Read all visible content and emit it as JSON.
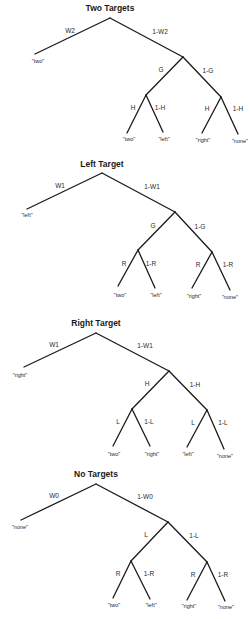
{
  "diagram": {
    "type": "probability-trees",
    "trees": [
      {
        "title": "Two Targets",
        "title_pos": [
          110,
          11
        ],
        "root": [
          110,
          18
        ],
        "left_leaf": {
          "pos": [
            35,
            54
          ],
          "label": "\"two\"",
          "label_pos": [
            38,
            63
          ],
          "edge_label": "W2",
          "edge_label_pos": [
            70,
            33
          ]
        },
        "right_node": {
          "pos": [
            183,
            57
          ],
          "edge_label": "1-W2",
          "edge_label_pos": [
            160,
            34
          ]
        },
        "mid_left": {
          "pos": [
            146,
            95
          ],
          "edge_label": "G",
          "edge_label_pos": [
            161,
            72
          ]
        },
        "mid_right": {
          "pos": [
            221,
            97
          ],
          "edge_label": "1-G",
          "edge_label_pos": [
            208,
            73
          ]
        },
        "leaves": [
          {
            "from": "mid_left",
            "pos": [
              127,
              133
            ],
            "label": "\"two\"",
            "label_pos": [
              129,
              141
            ],
            "edge_label": "H",
            "edge_label_pos": [
              133,
              110
            ]
          },
          {
            "from": "mid_left",
            "pos": [
              163,
              132
            ],
            "label": "\"left\"",
            "label_pos": [
              164,
              141
            ],
            "edge_label": "1-H",
            "edge_label_pos": [
              160,
              110
            ]
          },
          {
            "from": "mid_right",
            "pos": [
              202,
              133
            ],
            "label": "\"right\"",
            "label_pos": [
              203,
              142
            ],
            "edge_label": "H",
            "edge_label_pos": [
              207,
              111
            ]
          },
          {
            "from": "mid_right",
            "pos": [
              238,
              134
            ],
            "label": "\"none\"",
            "label_pos": [
              240,
              143
            ],
            "edge_label": "1-H",
            "edge_label_pos": [
              238,
              111
            ]
          }
        ]
      },
      {
        "title": "Left Target",
        "title_pos": [
          102,
          167
        ],
        "root": [
          102,
          173
        ],
        "left_leaf": {
          "pos": [
            27,
            209
          ],
          "label": "\"left\"",
          "label_pos": [
            27,
            217
          ],
          "edge_label": "W1",
          "edge_label_pos": [
            60,
            188
          ]
        },
        "right_node": {
          "pos": [
            175,
            212
          ],
          "edge_label": "1-W1",
          "edge_label_pos": [
            152,
            189
          ]
        },
        "mid_left": {
          "pos": [
            138,
            250
          ],
          "edge_label": "G",
          "edge_label_pos": [
            153,
            228
          ]
        },
        "mid_right": {
          "pos": [
            212,
            252
          ],
          "edge_label": "1-G",
          "edge_label_pos": [
            200,
            229
          ]
        },
        "leaves": [
          {
            "from": "mid_left",
            "pos": [
              118,
              286
            ],
            "label": "\"two\"",
            "label_pos": [
              120,
              297
            ],
            "edge_label": "R",
            "edge_label_pos": [
              124,
              266
            ]
          },
          {
            "from": "mid_left",
            "pos": [
              155,
              288
            ],
            "label": "\"left\"",
            "label_pos": [
              156,
              297
            ],
            "edge_label": "1-R",
            "edge_label_pos": [
              151,
              266
            ]
          },
          {
            "from": "mid_right",
            "pos": [
              192,
              288
            ],
            "label": "\"right\"",
            "label_pos": [
              194,
              298
            ],
            "edge_label": "R",
            "edge_label_pos": [
              198,
              267
            ]
          },
          {
            "from": "mid_right",
            "pos": [
              230,
              290
            ],
            "label": "\"none\"",
            "label_pos": [
              230,
              299
            ],
            "edge_label": "1-R",
            "edge_label_pos": [
              228,
              267
            ]
          }
        ]
      },
      {
        "title": "Right Target",
        "title_pos": [
          96,
          326
        ],
        "root": [
          96,
          333
        ],
        "left_leaf": {
          "pos": [
            24,
            367
          ],
          "label": "\"right\"",
          "label_pos": [
            20,
            377
          ],
          "edge_label": "W1",
          "edge_label_pos": [
            54,
            347
          ]
        },
        "right_node": {
          "pos": [
            169,
            371
          ],
          "edge_label": "1-W1",
          "edge_label_pos": [
            145,
            348
          ]
        },
        "mid_left": {
          "pos": [
            132,
            409
          ],
          "edge_label": "H",
          "edge_label_pos": [
            147,
            386
          ]
        },
        "mid_right": {
          "pos": [
            207,
            410
          ],
          "edge_label": "1-H",
          "edge_label_pos": [
            195,
            387
          ]
        },
        "leaves": [
          {
            "from": "mid_left",
            "pos": [
              113,
              446
            ],
            "label": "\"two\"",
            "label_pos": [
              114,
              456
            ],
            "edge_label": "L",
            "edge_label_pos": [
              118,
              424
            ]
          },
          {
            "from": "mid_left",
            "pos": [
              150,
              446
            ],
            "label": "\"right\"",
            "label_pos": [
              152,
              456
            ],
            "edge_label": "1-L",
            "edge_label_pos": [
              149,
              424
            ]
          },
          {
            "from": "mid_right",
            "pos": [
              187,
              447
            ],
            "label": "\"left\"",
            "label_pos": [
              188,
              456
            ],
            "edge_label": "L",
            "edge_label_pos": [
              193,
              425
            ]
          },
          {
            "from": "mid_right",
            "pos": [
              224,
              449
            ],
            "label": "\"none\"",
            "label_pos": [
              225,
              458
            ],
            "edge_label": "1-L",
            "edge_label_pos": [
              223,
              425
            ]
          }
        ]
      },
      {
        "title": "No Targets",
        "title_pos": [
          96,
          477
        ],
        "root": [
          96,
          484
        ],
        "left_leaf": {
          "pos": [
            21,
            520
          ],
          "label": "\"none\"",
          "label_pos": [
            20,
            529
          ],
          "edge_label": "W0",
          "edge_label_pos": [
            54,
            498
          ]
        },
        "right_node": {
          "pos": [
            168,
            522
          ],
          "edge_label": "1-W0",
          "edge_label_pos": [
            145,
            499
          ]
        },
        "mid_left": {
          "pos": [
            131,
            561
          ],
          "edge_label": "L",
          "edge_label_pos": [
            146,
            537
          ]
        },
        "mid_right": {
          "pos": [
            207,
            562
          ],
          "edge_label": "1-L",
          "edge_label_pos": [
            194,
            538
          ]
        },
        "leaves": [
          {
            "from": "mid_left",
            "pos": [
              113,
              598
            ],
            "label": "\"two\"",
            "label_pos": [
              114,
              607
            ],
            "edge_label": "R",
            "edge_label_pos": [
              118,
              576
            ]
          },
          {
            "from": "mid_left",
            "pos": [
              150,
              599
            ],
            "label": "\"left\"",
            "label_pos": [
              151,
              607
            ],
            "edge_label": "1-R",
            "edge_label_pos": [
              149,
              576
            ]
          },
          {
            "from": "mid_right",
            "pos": [
              187,
              600
            ],
            "label": "\"right\"",
            "label_pos": [
              189,
              608
            ],
            "edge_label": "R",
            "edge_label_pos": [
              193,
              577
            ]
          },
          {
            "from": "mid_right",
            "pos": [
              225,
              601
            ],
            "label": "\"none\"",
            "label_pos": [
              226,
              609
            ],
            "edge_label": "1-R",
            "edge_label_pos": [
              223,
              577
            ]
          }
        ]
      }
    ]
  },
  "colors": {
    "background": "#ffffff",
    "line": "#1a1a1a",
    "text": "#2a2a2a"
  }
}
